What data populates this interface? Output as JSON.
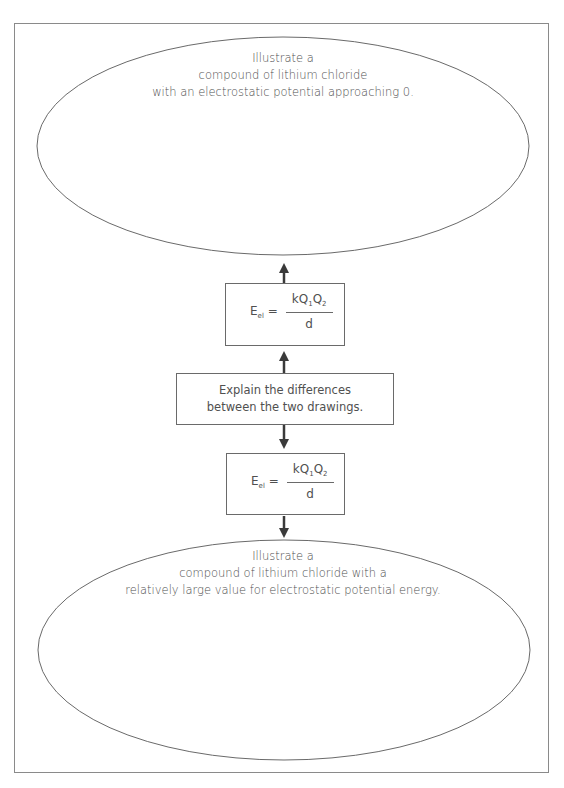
{
  "diagram": {
    "top_prompt": {
      "lines": [
        "Illustrate a",
        "compound of lithium chloride",
        "with an electrostatic potential approaching 0."
      ]
    },
    "equation_top": {
      "lhs": "E",
      "lhs_sub": "el",
      "equals": "=",
      "numerator_k": "kQ",
      "numerator_sub1": "1",
      "numerator_q2": "Q",
      "numerator_sub2": "2",
      "denominator": "d"
    },
    "middle_box": {
      "lines": [
        "Explain the differences",
        "between the two drawings."
      ]
    },
    "equation_bottom": {
      "lhs": "E",
      "lhs_sub": "el",
      "equals": "=",
      "numerator_k": "kQ",
      "numerator_sub1": "1",
      "numerator_q2": "Q",
      "numerator_sub2": "2",
      "denominator": "d"
    },
    "bottom_prompt": {
      "lines": [
        "Illustrate a",
        "compound of lithium chloride with a",
        "relatively large value for electrostatic potential energy."
      ]
    },
    "colors": {
      "stroke": "#6a6a6a",
      "arrow": "#3a3a3a",
      "text": "#505050"
    }
  }
}
